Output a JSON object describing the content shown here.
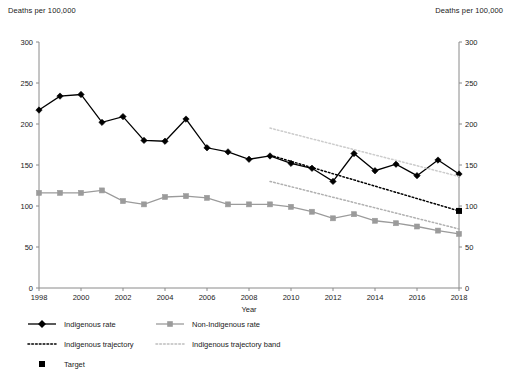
{
  "axis_unit_label_left": "Deaths per 100,000",
  "axis_unit_label_right": "Deaths per 100,000",
  "legend": {
    "items": [
      {
        "label": "Indigenous rate",
        "marker": "diamond-line",
        "color": "#000000"
      },
      {
        "label": "Non-Indigenous rate",
        "marker": "square-line",
        "color": "#9b9b9b"
      },
      {
        "label": "Indigenous trajectory",
        "marker": "dotted-line",
        "color": "#000000"
      },
      {
        "label": "Indigenous trajectory band",
        "marker": "dotted-line",
        "color": "#bdbdbd"
      },
      {
        "label": "Target",
        "marker": "square",
        "color": "#000000"
      }
    ]
  },
  "chart_data": {
    "type": "line",
    "title": "",
    "xlabel": "Year",
    "ylabel": "Deaths per 100,000",
    "y2label": "Deaths per 100,000",
    "xlim": [
      1998,
      2018
    ],
    "ylim": [
      0,
      300
    ],
    "yticks": [
      0,
      50,
      100,
      150,
      200,
      250,
      300
    ],
    "xticks": [
      1998,
      2000,
      2002,
      2004,
      2006,
      2008,
      2010,
      2012,
      2014,
      2016,
      2018
    ],
    "grid": false,
    "legend_position": "below",
    "x": [
      1998,
      1999,
      2000,
      2001,
      2002,
      2003,
      2004,
      2005,
      2006,
      2007,
      2008,
      2009,
      2010,
      2011,
      2012,
      2013,
      2014,
      2015,
      2016,
      2017,
      2018
    ],
    "series": [
      {
        "name": "Indigenous rate",
        "color": "#000000",
        "marker": "diamond",
        "style": "solid",
        "values": [
          217,
          234,
          236,
          202,
          209,
          180,
          179,
          206,
          171,
          166,
          157,
          161,
          152,
          146,
          130,
          164,
          143,
          151,
          137,
          156,
          139
        ]
      },
      {
        "name": "Non-Indigenous rate",
        "color": "#9b9b9b",
        "marker": "square",
        "style": "solid",
        "values": [
          116,
          116,
          116,
          119,
          106,
          102,
          111,
          112,
          110,
          102,
          102,
          102,
          99,
          93,
          85,
          90,
          82,
          79,
          75,
          70,
          66
        ]
      },
      {
        "name": "Indigenous trajectory",
        "color": "#000000",
        "marker": "none",
        "style": "dotted",
        "x": [
          2009,
          2018
        ],
        "values": [
          162,
          94
        ]
      },
      {
        "name": "Indigenous trajectory band upper",
        "color": "#cccccc",
        "marker": "none",
        "style": "dotted",
        "x": [
          2009,
          2018
        ],
        "values": [
          195,
          136
        ]
      },
      {
        "name": "Indigenous trajectory band lower",
        "color": "#b0b0b0",
        "marker": "none",
        "style": "dotted",
        "x": [
          2009,
          2018
        ],
        "values": [
          130,
          72
        ]
      }
    ],
    "target_point": {
      "name": "Target",
      "x": 2018,
      "y": 94,
      "color": "#000000",
      "marker": "square"
    }
  }
}
